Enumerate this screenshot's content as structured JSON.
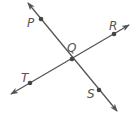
{
  "diagram": {
    "type": "intersecting-lines",
    "line_color": "#555555",
    "point_color": "#444444",
    "lines": [
      {
        "name": "PS",
        "from": [
          28,
          3
        ],
        "to": [
          117,
          111
        ]
      },
      {
        "name": "TR",
        "from": [
          11,
          94
        ],
        "to": [
          129,
          25
        ]
      }
    ],
    "points": [
      {
        "label": "P",
        "x": 41,
        "y": 19,
        "lx": 27,
        "ly": 27
      },
      {
        "label": "Q",
        "x": 72,
        "y": 59,
        "lx": 67,
        "ly": 52
      },
      {
        "label": "R",
        "x": 114,
        "y": 34,
        "lx": 109,
        "ly": 30
      },
      {
        "label": "T",
        "x": 30,
        "y": 83,
        "lx": 21,
        "ly": 82
      },
      {
        "label": "S",
        "x": 99,
        "y": 90,
        "lx": 87,
        "ly": 98
      }
    ]
  }
}
